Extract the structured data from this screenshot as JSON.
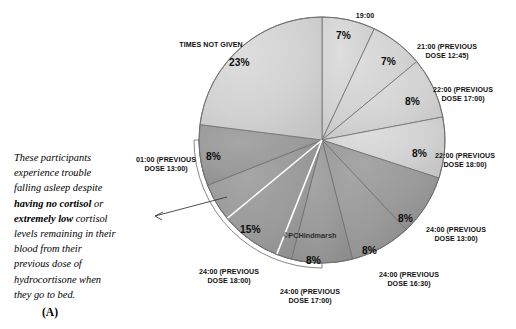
{
  "panel": {
    "letter": "(A)"
  },
  "chart_title": "",
  "watermark": {
    "text": "©PCHindmarsh"
  },
  "annotation": {
    "line1": "These participants",
    "line2": "experience trouble",
    "line3": "falling asleep despite",
    "bold1": "having no cortisol",
    "mid1": " or",
    "bold2": "extremely low",
    "mid2": " cortisol",
    "line6": "levels remaining in their",
    "line7": "blood from their",
    "line8": "previous dose of",
    "line9": "hydrocortisone when",
    "line10": "they go to bed."
  },
  "chart_data": {
    "type": "pie",
    "title": "",
    "start_angle_deg": 0,
    "direction": "clockwise",
    "legend": "none (direct labels with leader-free placement)",
    "colors": {
      "light": "#d2d2d2",
      "dark": "#9a9a9a",
      "outline": "#6f6f6f",
      "shadow": "#8f8f8f"
    },
    "categories": [
      "19:00",
      "21:00 (PREVIOUS DOSE 12:45)",
      "22:00 (PREVIOUS DOSE 17:00)",
      "22:00 (PREVIOUS DOSE 18:00)",
      "24:00 (PREVIOUS DOSE 13:00)",
      "24:00 (PREVIOUS DOSE 16:30)",
      "24:00 (PREVIOUS DOSE 17:00)",
      "24:00 (PREVIOUS DOSE 18:00)",
      "01:00 (PREVIOUS DOSE 13:00)",
      "TIMES NOT GIVEN"
    ],
    "values": [
      7,
      7,
      8,
      8,
      8,
      8,
      8,
      15,
      8,
      23
    ],
    "value_labels": [
      "7%",
      "7%",
      "8%",
      "8%",
      "8%",
      "8%",
      "8%",
      "15%",
      "8%",
      "23%"
    ],
    "unit": "%",
    "xlabel": "",
    "ylabel": ""
  },
  "slices": [
    {
      "name": "19:00",
      "cat": "19:00",
      "pct": "7%",
      "cat_x": 343,
      "cat_y": 12,
      "cat_w": 44,
      "pct_x": 336,
      "pct_y": 30
    },
    {
      "name": "21:00 (PREVIOUS\nDOSE 12:45)",
      "cat": "21:00 (PREVIOUS\nDOSE 12:45)",
      "pct": "7%",
      "cat_x": 404,
      "cat_y": 43,
      "cat_w": 86,
      "pct_x": 381,
      "pct_y": 56
    },
    {
      "name": "22:00 (PREVIOUS\nDOSE 17:00)",
      "cat": "22:00 (PREVIOUS\nDOSE 17:00)",
      "pct": "8%",
      "cat_x": 420,
      "cat_y": 86,
      "cat_w": 86,
      "pct_x": 405,
      "pct_y": 96
    },
    {
      "name": "22:00 (PREVIOUS\nDOSE 18:00)",
      "cat": "22:00 (PREVIOUS\nDOSE 18:00)",
      "pct": "8%",
      "cat_x": 422,
      "cat_y": 152,
      "cat_w": 86,
      "pct_x": 412,
      "pct_y": 148
    },
    {
      "name": "24:00 (PREVIOUS\nDOSE 13:00)",
      "cat": "24:00 (PREVIOUS\nDOSE 13:00)",
      "pct": "8%",
      "cat_x": 413,
      "cat_y": 226,
      "cat_w": 86,
      "pct_x": 398,
      "pct_y": 213
    },
    {
      "name": "24:00 (PREVIOUS\nDOSE 16:30)",
      "cat": "24:00 (PREVIOUS\nDOSE 16:30)",
      "pct": "8%",
      "cat_x": 366,
      "cat_y": 271,
      "cat_w": 86,
      "pct_x": 362,
      "pct_y": 245
    },
    {
      "name": "24:00 (PREVIOUS\nDOSE 17:00)",
      "cat": "24:00 (PREVIOUS\nDOSE 17:00)",
      "pct": "8%",
      "cat_x": 267,
      "cat_y": 288,
      "cat_w": 86,
      "pct_x": 306,
      "pct_y": 255
    },
    {
      "name": "24:00 (PREVIOUS\nDOSE 18:00)",
      "cat": "24:00 (PREVIOUS\nDOSE 18:00)",
      "pct": "15%",
      "cat_x": 186,
      "cat_y": 268,
      "cat_w": 86,
      "pct_x": 240,
      "pct_y": 224
    },
    {
      "name": "01:00 (PREVIOUS\nDOSE 13:00)",
      "cat": "01:00 (PREVIOUS\nDOSE 13:00)",
      "pct": "8%",
      "cat_x": 123,
      "cat_y": 156,
      "cat_w": 86,
      "pct_x": 206,
      "pct_y": 151
    },
    {
      "name": "TIMES NOT GIVEN",
      "cat": "TIMES NOT GIVEN",
      "pct": "23%",
      "cat_x": 166,
      "cat_y": 41,
      "cat_w": 90,
      "pct_x": 229,
      "pct_y": 57
    }
  ],
  "watermark_pos": {
    "x": 283,
    "y": 231
  }
}
